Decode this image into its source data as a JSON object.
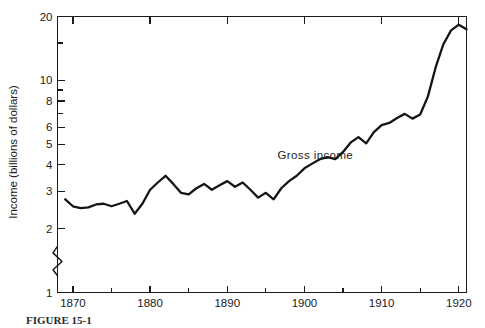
{
  "figure": {
    "caption": "FIGURE 15-1",
    "series_label": "Gross income"
  },
  "chart_data": {
    "type": "line",
    "title": "",
    "subtitle": "",
    "xlabel": "",
    "ylabel": "Income (billions of dollars)",
    "yscale": "log",
    "ylim": [
      1,
      20
    ],
    "xlim": [
      1868,
      1921
    ],
    "grid": false,
    "legend": "inline-annotation",
    "annotations": [
      {
        "text": "Gross income",
        "x": 1896.5,
        "y": 4.25
      }
    ],
    "y_ticks_major": [
      1,
      2,
      3,
      4,
      5,
      6,
      8,
      10,
      20
    ],
    "y_tick_labels": [
      "1",
      "2",
      "3",
      "4",
      "5",
      "6",
      "8",
      "10",
      "20"
    ],
    "y_ticks_minor": [
      7,
      9,
      15
    ],
    "x_ticks_major": [
      1870,
      1880,
      1890,
      1900,
      1910,
      1920
    ],
    "x_tick_labels": [
      "1870",
      "1880",
      "1890",
      "1900",
      "1910",
      "1920"
    ],
    "x_ticks_minor": [
      1875,
      1885,
      1895,
      1905,
      1915
    ],
    "axis_break": {
      "axis": "y",
      "between": [
        1,
        2
      ]
    },
    "series": [
      {
        "name": "Gross income",
        "x": [
          1869,
          1870,
          1871,
          1872,
          1873,
          1874,
          1875,
          1876,
          1877,
          1878,
          1879,
          1880,
          1881,
          1882,
          1883,
          1884,
          1885,
          1886,
          1887,
          1888,
          1889,
          1890,
          1891,
          1892,
          1893,
          1894,
          1895,
          1896,
          1897,
          1898,
          1899,
          1900,
          1901,
          1902,
          1903,
          1904,
          1905,
          1906,
          1907,
          1908,
          1909,
          1910,
          1911,
          1912,
          1913,
          1914,
          1915,
          1916,
          1917,
          1918,
          1919,
          1920,
          1921
        ],
        "values": [
          2.75,
          2.55,
          2.5,
          2.52,
          2.6,
          2.62,
          2.55,
          2.62,
          2.7,
          2.35,
          2.62,
          3.05,
          3.3,
          3.55,
          3.25,
          2.95,
          2.9,
          3.1,
          3.25,
          3.05,
          3.2,
          3.35,
          3.15,
          3.3,
          3.05,
          2.8,
          2.95,
          2.75,
          3.1,
          3.35,
          3.55,
          3.85,
          4.05,
          4.25,
          4.35,
          4.25,
          4.6,
          5.1,
          5.4,
          5.05,
          5.7,
          6.15,
          6.3,
          6.65,
          6.95,
          6.6,
          6.9,
          8.4,
          11.5,
          14.8,
          17.2,
          18.3,
          17.4
        ]
      }
    ]
  }
}
